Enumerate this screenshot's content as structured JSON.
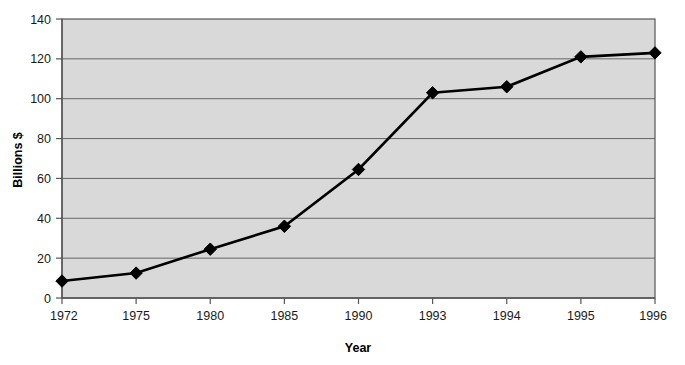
{
  "chart_data": {
    "type": "line",
    "title": "",
    "xlabel": "Year",
    "ylabel": "Billions $",
    "categories": [
      "1972",
      "1975",
      "1980",
      "1985",
      "1990",
      "1993",
      "1994",
      "1995",
      "1996"
    ],
    "values": [
      8.5,
      12.5,
      24.5,
      36,
      64.5,
      103,
      106,
      121,
      123
    ],
    "series": [
      {
        "name": "Billions $",
        "values": [
          8.5,
          12.5,
          24.5,
          36,
          64.5,
          103,
          106,
          121,
          123
        ]
      }
    ],
    "ylim": [
      0,
      140
    ],
    "ytick_labels": [
      "0",
      "20",
      "40",
      "60",
      "80",
      "100",
      "120",
      "140"
    ],
    "ytick_values": [
      0,
      20,
      40,
      60,
      80,
      100,
      120,
      140
    ],
    "grid": "horizontal",
    "legend": "none",
    "marker": "diamond",
    "colors": {
      "line": "#000000",
      "marker": "#000000",
      "plot_background": "#d9d9d9",
      "plot_border": "#555555",
      "gridline": "#666666",
      "axis": "#555555",
      "page_background": "#ffffff",
      "text": "#1a1a1a"
    }
  }
}
